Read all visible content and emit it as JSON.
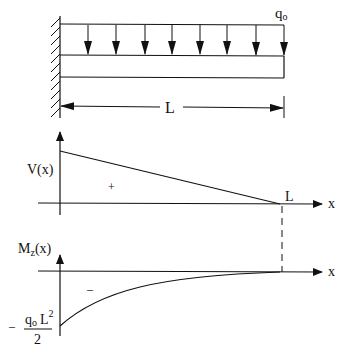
{
  "beam": {
    "load_label": "q",
    "load_sub": "o",
    "length_label": "L",
    "support": "fixed-wall",
    "load_arrow_count": 8
  },
  "shear_diagram": {
    "ylabel": "V(x)",
    "xlabel": "x",
    "sign": "+",
    "end_label": "L"
  },
  "moment_diagram": {
    "ylabel_main": "M",
    "ylabel_sub": "z",
    "ylabel_tail": "(x)",
    "xlabel": "x",
    "sign": "–",
    "min_prefix": "–",
    "min_num_q": "q",
    "min_num_sub": "o",
    "min_num_L": "L",
    "min_num_exp": "2",
    "min_den": "2"
  }
}
